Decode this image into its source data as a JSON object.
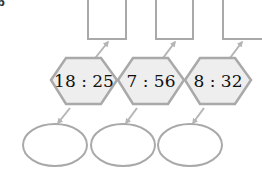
{
  "problem_label": "b",
  "colors": {
    "stroke": "#a9a9a9",
    "hex_fill": "#eeeeee",
    "text": "#111111",
    "background": "#ffffff"
  },
  "ratios": [
    {
      "text": "18 : 25",
      "antecedent": "18",
      "consequent": "25"
    },
    {
      "text": "7 : 56",
      "antecedent": "7",
      "consequent": "56"
    },
    {
      "text": "8 : 32",
      "antecedent": "8",
      "consequent": "32"
    }
  ],
  "answer_boxes_top": [
    "",
    "",
    ""
  ],
  "answer_ovals_bottom": [
    "",
    "",
    ""
  ]
}
